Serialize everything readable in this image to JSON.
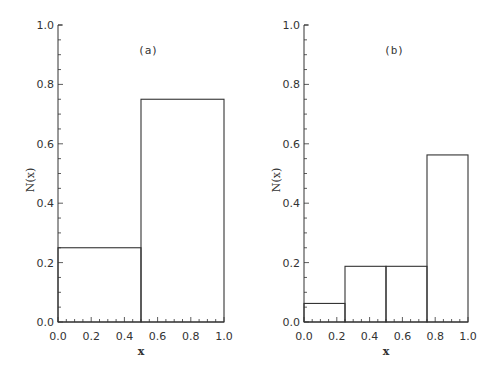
{
  "chart_data": [
    {
      "type": "bar",
      "subtype": "histogram",
      "panel_label": "(a)",
      "title": "",
      "xlabel": "x",
      "ylabel": "N(x)",
      "bin_edges": [
        0.0,
        0.5,
        1.0
      ],
      "values": [
        0.25,
        0.75
      ],
      "xlim": [
        0.0,
        1.0
      ],
      "ylim": [
        0.0,
        1.0
      ],
      "x_ticks": [
        "0.0",
        "0.2",
        "0.4",
        "0.6",
        "0.8",
        "1.0"
      ],
      "y_ticks": [
        "0.0",
        "0.2",
        "0.4",
        "0.6",
        "0.8",
        "1.0"
      ],
      "grid": false,
      "legend": null
    },
    {
      "type": "bar",
      "subtype": "histogram",
      "panel_label": "(b)",
      "title": "",
      "xlabel": "x",
      "ylabel": "N(x)",
      "bin_edges": [
        0.0,
        0.25,
        0.5,
        0.75,
        1.0
      ],
      "values": [
        0.0625,
        0.1875,
        0.1875,
        0.5625
      ],
      "xlim": [
        0.0,
        1.0
      ],
      "ylim": [
        0.0,
        1.0
      ],
      "x_ticks": [
        "0.0",
        "0.2",
        "0.4",
        "0.6",
        "0.8",
        "1.0"
      ],
      "y_ticks": [
        "0.0",
        "0.2",
        "0.4",
        "0.6",
        "0.8",
        "1.0"
      ],
      "grid": false,
      "legend": null
    }
  ],
  "style": {
    "line_color": "#333333",
    "background": "#ffffff"
  }
}
